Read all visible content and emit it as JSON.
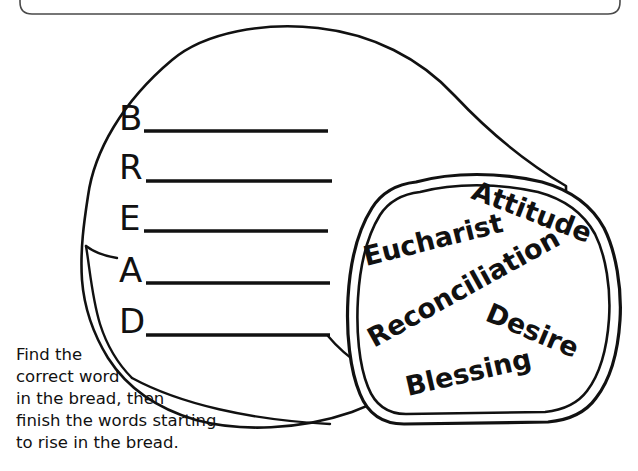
{
  "worksheet": {
    "title": "BREAD acrostic worksheet",
    "ink_color": "#111111",
    "paper_color": "#ffffff",
    "border_color": "#4a4a4a"
  },
  "acrostic": {
    "name": "BREAD",
    "rows": [
      {
        "letter": "B",
        "answer": ""
      },
      {
        "letter": "R",
        "answer": ""
      },
      {
        "letter": "E",
        "answer": ""
      },
      {
        "letter": "A",
        "answer": ""
      },
      {
        "letter": "D",
        "answer": ""
      }
    ]
  },
  "bread_slice": {
    "words": [
      {
        "text": "Attitude",
        "rotation": 21
      },
      {
        "text": "Eucharist",
        "rotation": -14
      },
      {
        "text": "Reconciliation",
        "rotation": -29
      },
      {
        "text": "Desire",
        "rotation": 23
      },
      {
        "text": "Blessing",
        "rotation": -13
      }
    ]
  },
  "instructions": {
    "lines": [
      "Find the",
      "correct word",
      "in the bread, then",
      "finish the words starting",
      "to rise in the bread."
    ],
    "full_text": "Find the correct word in the bread, then finish the words starting to rise in the bread."
  }
}
